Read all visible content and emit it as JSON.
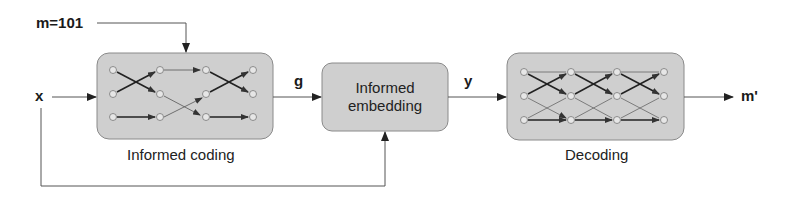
{
  "diagram": {
    "labels": {
      "message": "m=101",
      "input": "x",
      "codeword": "g",
      "watermarked": "y",
      "output": "m'"
    },
    "blocks": [
      {
        "id": "informed-coding",
        "caption": "Informed coding"
      },
      {
        "id": "informed-embedding",
        "line1": "Informed",
        "line2": "embedding"
      },
      {
        "id": "decoding",
        "caption": "Decoding"
      }
    ],
    "colors": {
      "block_fill": "#cfcfcf",
      "block_stroke": "#8a8a8a",
      "line": "#555555",
      "arrow": "#222222",
      "node_fill": "#e6e6e6",
      "node_stroke": "#777777"
    }
  }
}
